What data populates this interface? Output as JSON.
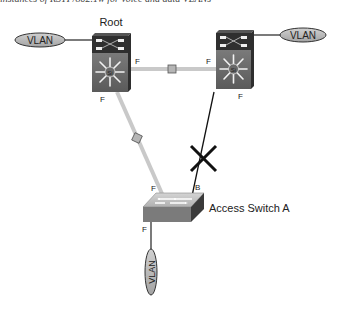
{
  "caption": "instances of RSTP/802.1w for voice and data VLANs",
  "colors": {
    "switch_dark": "#3a3a3a",
    "switch_mid": "#6e6e6e",
    "switch_face": "#8a8a8a",
    "link_grey": "#c9c9c9",
    "link_black": "#111111",
    "vlan_fill": "#b8b8b8",
    "blocked_mark": "#111111"
  },
  "nodes": {
    "root_switch": {
      "label": "Root",
      "type": "multilayer-switch"
    },
    "right_switch": {
      "label": "",
      "type": "multilayer-switch"
    },
    "access_switch": {
      "label": "Access Switch A",
      "type": "workgroup-switch"
    },
    "vlan_left": {
      "label": "VLAN"
    },
    "vlan_right": {
      "label": "VLAN"
    },
    "vlan_bottom": {
      "label": "VLAN"
    }
  },
  "port_labels": {
    "root_right": "F",
    "root_bottom": "F",
    "right_left": "F",
    "right_bottom": "F",
    "access_left": "F",
    "access_right": "B",
    "access_bottom": "F"
  },
  "links": [
    {
      "from": "root_switch",
      "to": "right_switch",
      "style": "forwarding",
      "color": "grey"
    },
    {
      "from": "root_switch",
      "to": "access_switch",
      "style": "forwarding",
      "color": "grey"
    },
    {
      "from": "right_switch",
      "to": "access_switch",
      "style": "blocked",
      "color": "black"
    }
  ]
}
